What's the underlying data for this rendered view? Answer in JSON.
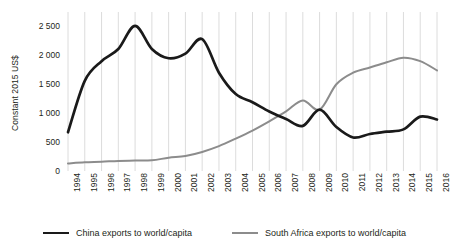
{
  "chart_data": {
    "type": "line",
    "title": "",
    "xlabel": "",
    "ylabel": "Constant 2015 US$",
    "ylim": [
      0,
      2750
    ],
    "yticks": [
      0,
      500,
      1000,
      1500,
      2000,
      2500
    ],
    "ytick_labels": [
      "0",
      "500",
      "1 000",
      "1 500",
      "2 000",
      "2 500"
    ],
    "grid": "vertical",
    "legend_position": "bottom",
    "categories": [
      "1994",
      "1995",
      "1996",
      "1997",
      "1998",
      "1999",
      "2000",
      "2001",
      "2002",
      "2003",
      "2004",
      "2005",
      "2006",
      "2007",
      "2008",
      "2009",
      "2010",
      "2011",
      "2012",
      "2013",
      "2014",
      "2015",
      "2016"
    ],
    "x": [
      1994,
      1995,
      1996,
      1997,
      1998,
      1999,
      2000,
      2001,
      2002,
      2003,
      2004,
      2005,
      2006,
      2007,
      2008,
      2009,
      2010,
      2011,
      2012,
      2013,
      2014,
      2015,
      2016
    ],
    "series": [
      {
        "name": "China exports to world/capita",
        "color": "#1a1a1a",
        "values": [
          670,
          1560,
          1900,
          2110,
          2510,
          2110,
          1950,
          2030,
          2280,
          1700,
          1330,
          1190,
          1030,
          900,
          780,
          1060,
          760,
          580,
          640,
          680,
          720,
          940,
          890
        ]
      },
      {
        "name": "South Africa exports to world/capita",
        "color": "#8c8c8c",
        "values": [
          130,
          150,
          160,
          175,
          180,
          185,
          230,
          260,
          330,
          430,
          560,
          700,
          860,
          1030,
          1220,
          1060,
          1500,
          1700,
          1790,
          1880,
          1960,
          1900,
          1740
        ]
      }
    ]
  },
  "legend": {
    "items": [
      {
        "label": "China exports to world/capita",
        "swatch": "line-swatch-black"
      },
      {
        "label": "South Africa exports to world/capita",
        "swatch": "line-swatch-gray"
      }
    ]
  },
  "axes": {
    "y_title": "Constant 2015 US$"
  }
}
